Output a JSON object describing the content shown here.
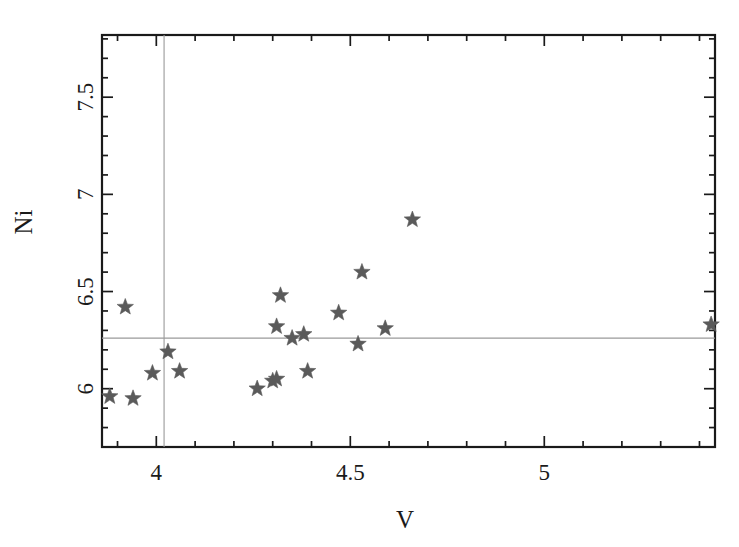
{
  "chart_data": {
    "type": "scatter",
    "title": "",
    "xlabel": "V",
    "ylabel": "Ni",
    "xlim": [
      3.86,
      5.44
    ],
    "ylim": [
      5.7,
      7.82
    ],
    "xticks": [
      4,
      4.5,
      5
    ],
    "xtick_labels": [
      "4",
      "4.5",
      "5"
    ],
    "yticks": [
      6,
      6.5,
      7,
      7.5
    ],
    "ytick_labels": [
      "6",
      "6.5",
      "7",
      "7.5"
    ],
    "x_minor_step": 0.1,
    "y_minor_step": 0.1,
    "grid": false,
    "legend": null,
    "marker": "star",
    "marker_color": "#5a5a5a",
    "frame_color": "#1a1a1a",
    "reference_lines": {
      "vertical_x": 4.02,
      "horizontal_y": 6.26,
      "color": "#9a9a9a"
    },
    "points": [
      {
        "x": 3.88,
        "y": 5.96
      },
      {
        "x": 3.92,
        "y": 6.42
      },
      {
        "x": 3.94,
        "y": 5.95
      },
      {
        "x": 3.99,
        "y": 6.08
      },
      {
        "x": 4.03,
        "y": 6.19
      },
      {
        "x": 4.06,
        "y": 6.09
      },
      {
        "x": 4.26,
        "y": 6.0
      },
      {
        "x": 4.3,
        "y": 6.04
      },
      {
        "x": 4.31,
        "y": 6.05
      },
      {
        "x": 4.31,
        "y": 6.32
      },
      {
        "x": 4.32,
        "y": 6.48
      },
      {
        "x": 4.35,
        "y": 6.26
      },
      {
        "x": 4.38,
        "y": 6.28
      },
      {
        "x": 4.39,
        "y": 6.09
      },
      {
        "x": 4.47,
        "y": 6.39
      },
      {
        "x": 4.52,
        "y": 6.23
      },
      {
        "x": 4.53,
        "y": 6.6
      },
      {
        "x": 4.59,
        "y": 6.31
      },
      {
        "x": 4.66,
        "y": 6.87
      },
      {
        "x": 5.43,
        "y": 6.33
      }
    ]
  },
  "axis": {
    "y_title": "Ni",
    "x_title": "V"
  }
}
